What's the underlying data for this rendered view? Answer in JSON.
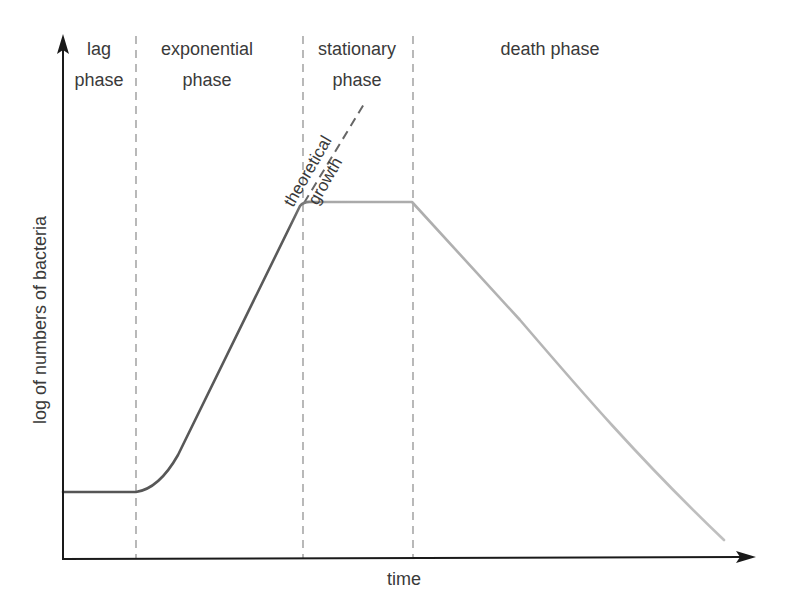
{
  "diagram": {
    "y_axis_label": "log of numbers of bacteria",
    "x_axis_label": "time",
    "phases": [
      {
        "line1": "lag",
        "line2": "phase"
      },
      {
        "line1": "exponential",
        "line2": "phase"
      },
      {
        "line1": "stationary",
        "line2": "phase"
      },
      {
        "line1": "death phase",
        "line2": ""
      }
    ],
    "annotation": {
      "line1": "theoretical",
      "line2": "growth"
    },
    "colors": {
      "axis": "#1a1a1a",
      "divider": "#8a8a8a",
      "curve_early": "#555555",
      "curve_late": "#b5b5b5",
      "theoretical": "#666666"
    }
  }
}
